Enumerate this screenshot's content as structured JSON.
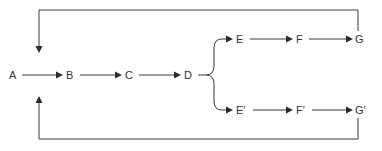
{
  "diagram": {
    "nodes": {
      "A": "A",
      "B": "B",
      "C": "C",
      "D": "D",
      "E": "E",
      "F": "F",
      "G": "G",
      "E_prime": "E′",
      "F_prime": "F′",
      "G_prime": "G′"
    },
    "edges": [
      [
        "A",
        "B"
      ],
      [
        "B",
        "C"
      ],
      [
        "C",
        "D"
      ],
      [
        "D",
        "E"
      ],
      [
        "D",
        "E′"
      ],
      [
        "E",
        "F"
      ],
      [
        "F",
        "G"
      ],
      [
        "E′",
        "F′"
      ],
      [
        "F′",
        "G′"
      ],
      [
        "G",
        "B (feedback, top loop)"
      ],
      [
        "G′",
        "B (feedback, bottom loop)"
      ]
    ],
    "colors": {
      "line": "#3a3a3a",
      "text": "#333333",
      "background": "#ffffff"
    }
  }
}
